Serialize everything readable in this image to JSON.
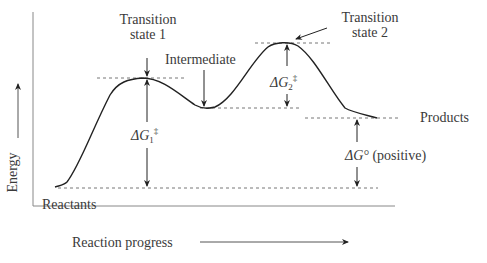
{
  "diagram": {
    "type": "reaction-energy-profile",
    "y_axis_label": "Energy",
    "x_axis_label": "Reaction progress",
    "labels": {
      "ts1_line1": "Transition",
      "ts1_line2": "state 1",
      "ts2_line1": "Transition",
      "ts2_line2": "state 2",
      "intermediate": "Intermediate",
      "products": "Products",
      "reactants": "Reactants",
      "dg1": "ΔG",
      "dg1_sub": "1",
      "dg1_sup": "‡",
      "dg2": "ΔG",
      "dg2_sub": "2",
      "dg2_sup": "‡",
      "dg0": "ΔG°",
      "dg0_note": "(positive)"
    },
    "levels": {
      "reactants_y": 187,
      "ts1_y": 78,
      "intermediate_y": 108,
      "ts2_y": 43,
      "products_y": 118
    },
    "colors": {
      "curve": "#222222",
      "axis": "#777777",
      "dashed": "#777777",
      "text": "#3a3a3a"
    }
  }
}
